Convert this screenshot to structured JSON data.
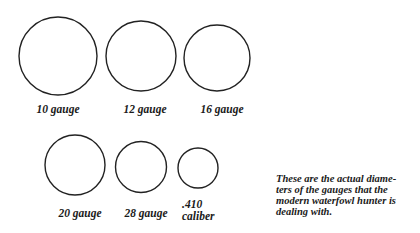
{
  "gauges": [
    {
      "label": "10 gauge"
    },
    {
      "label": "12 gauge"
    },
    {
      "label": "16 gauge"
    },
    {
      "label": "20 gauge"
    },
    {
      "label": "28 gauge"
    },
    {
      "label": ".410",
      "label2": "caliber"
    }
  ],
  "caption": "These are the actual diameters of the gauges that the modern waterfowl hunter is dealing with.",
  "caption_lines": [
    "These are the actual diame-",
    "ters of the gauges that the",
    "modern waterfowl hunter is",
    "dealing with."
  ],
  "colors": {
    "stroke": "#222222",
    "text": "#1a1a1a"
  }
}
